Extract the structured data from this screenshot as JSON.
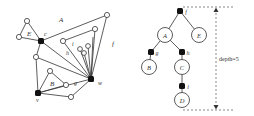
{
  "left_graph": {
    "face_labels": {
      "A": "A",
      "E": "E",
      "B": "B",
      "f": "f",
      "i": "i",
      "h": "h",
      "g": "g"
    },
    "vertex_labels": {
      "c": "c",
      "w": "w",
      "v": "v"
    }
  },
  "right_tree": {
    "nodes": {
      "f": "f",
      "A": "A",
      "E": "E",
      "g": "g",
      "h": "h",
      "B": "B",
      "C": "C",
      "i": "i",
      "D": "D"
    },
    "depth_label": "depth=5"
  },
  "colors": {
    "stroke": "#333333",
    "fill_black": "#111111",
    "dash": "#555555"
  }
}
